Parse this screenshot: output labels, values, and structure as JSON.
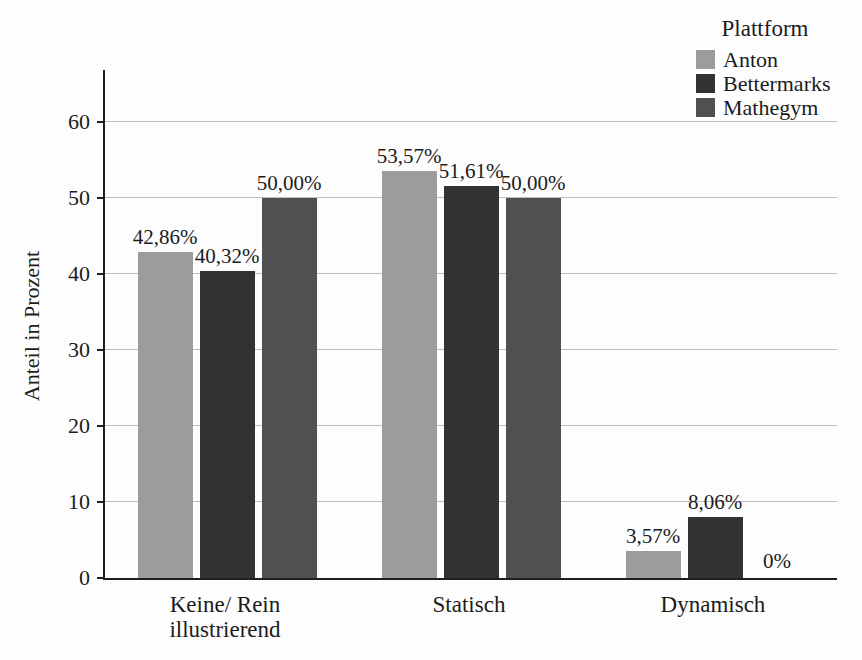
{
  "figure": {
    "background": "#fdfdfd",
    "text_color": "#1c1c1c",
    "axis_color": "#1f1f1f",
    "gridline_color": "#bdbdbd"
  },
  "chart_data": {
    "type": "bar",
    "title": "",
    "xlabel": "",
    "ylabel": "Anteil in Prozent",
    "categories": [
      "Keine/ Rein illustrierend",
      "Statisch",
      "Dynamisch"
    ],
    "category_lines": [
      [
        "Keine/ Rein",
        "illustrierend"
      ],
      [
        "Statisch"
      ],
      [
        "Dynamisch"
      ]
    ],
    "series": [
      {
        "name": "Anton",
        "color": "#9c9c9c",
        "values": [
          42.86,
          53.57,
          3.57
        ],
        "value_labels": [
          "42,86%",
          "53,57%",
          "3,57%"
        ]
      },
      {
        "name": "Bettermarks",
        "color": "#323232",
        "values": [
          40.32,
          51.61,
          8.06
        ],
        "value_labels": [
          "40,32%",
          "51,61%",
          "8,06%"
        ]
      },
      {
        "name": "Mathegym",
        "color": "#505050",
        "values": [
          50.0,
          50.0,
          0.0
        ],
        "value_labels": [
          "50,00%",
          "50,00%",
          "0%"
        ]
      }
    ],
    "y_ticks": [
      0,
      10,
      20,
      30,
      40,
      50,
      60
    ],
    "ylim": [
      0,
      66.8
    ],
    "grid": true,
    "legend_title": "Plattform",
    "legend_position": "top-right"
  }
}
